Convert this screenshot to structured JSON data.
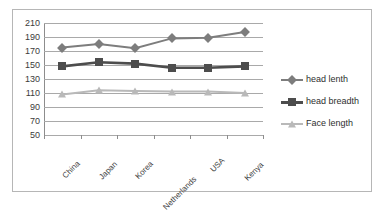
{
  "chart_data": {
    "type": "line",
    "title": "",
    "subtitle": "",
    "xlabel": "",
    "ylabel": "",
    "categories": [
      "China",
      "Japan",
      "Korea",
      "Netherlands",
      "USA",
      "Kenya"
    ],
    "series": [
      {
        "name": "head lenth",
        "marker": "diamond",
        "color": "#7d7d7d",
        "values": [
          175,
          180,
          174,
          188,
          189,
          197
        ]
      },
      {
        "name": "head breadth",
        "marker": "square",
        "color": "#4d4d4d",
        "values": [
          148,
          154,
          152,
          146,
          146,
          148
        ]
      },
      {
        "name": "Face length",
        "marker": "triangle",
        "color": "#b9b9b9",
        "values": [
          108,
          114,
          113,
          112,
          112,
          110
        ]
      }
    ],
    "ylim": [
      50,
      210
    ],
    "ytick_step": 20,
    "yticks": [
      210,
      190,
      170,
      150,
      130,
      110,
      90,
      70,
      50
    ],
    "grid": true,
    "legend_position": "right",
    "x_label_rotation": -45
  },
  "legend": {
    "entries": [
      {
        "label": "head lenth"
      },
      {
        "label": "head breadth"
      },
      {
        "label": "Face length"
      }
    ]
  }
}
